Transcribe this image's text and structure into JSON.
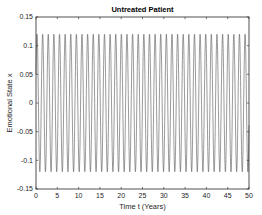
{
  "chart_data": {
    "type": "line",
    "title": "Untreated Patient",
    "xlabel": "Time  t (Years)",
    "ylabel": "Emotional State  x",
    "xlim": [
      0,
      50
    ],
    "ylim": [
      -0.15,
      0.15
    ],
    "xticks": [
      0,
      5,
      10,
      15,
      20,
      25,
      30,
      35,
      40,
      45,
      50
    ],
    "yticks": [
      -0.15,
      -0.1,
      -0.05,
      0,
      0.05,
      0.1,
      0.15
    ],
    "xtick_labels": [
      "0",
      "5",
      "10",
      "15",
      "20",
      "25",
      "30",
      "35",
      "40",
      "45",
      "50"
    ],
    "ytick_labels": [
      "-0.15",
      "-0.1",
      "-0.05",
      "0",
      "0.05",
      "0.1",
      "0.15"
    ],
    "grid": false,
    "legend": null,
    "series": [
      {
        "name": "x(t)",
        "color": "#555555",
        "description": "Sustained oscillation, amplitude ~0.12, period ~1.32 years (~38 cycles over 50 years)",
        "amplitude": 0.12,
        "period": 1.32,
        "x_start": 0,
        "x_end": 50,
        "y_start": 0.05,
        "peak_value": 0.12,
        "trough_value": -0.12
      }
    ]
  },
  "colors": {
    "line": "#555555",
    "axes": "#262626",
    "background": "#ffffff"
  }
}
